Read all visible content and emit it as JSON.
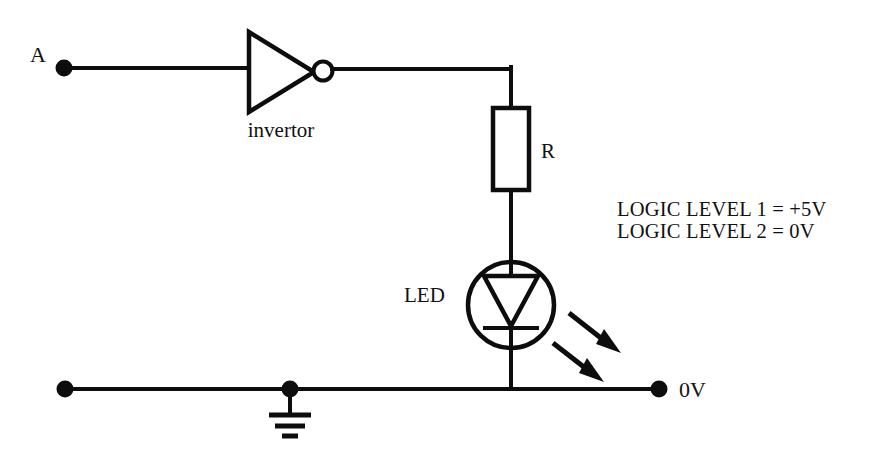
{
  "diagram": {
    "background_color": "#ffffff",
    "ink_color": "#0d0d0d"
  },
  "labels": {
    "input_terminal": "A",
    "invertor": "invertor",
    "resistor": "R",
    "led": "LED",
    "ground_terminal": "0V"
  },
  "notes": {
    "line1": "LOGIC LEVEL 1 = +5V",
    "line2": "LOGIC LEVEL 2 = 0V"
  },
  "icons": {
    "input_node": "junction-dot-icon",
    "output_node": "junction-dot-icon",
    "ground": "earth-ground-icon",
    "invertor": "not-gate-icon",
    "inverting_bubble": "inversion-bubble-icon",
    "resistor": "resistor-icon",
    "led": "led-icon",
    "emission_rays": "light-emission-arrows-icon"
  }
}
